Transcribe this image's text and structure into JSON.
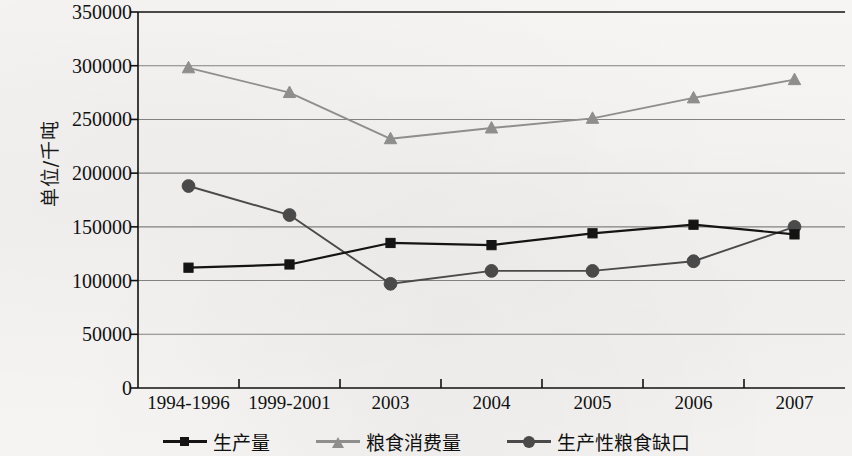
{
  "axis": {
    "y_title": "单位/千吨",
    "y_ticks": [
      "0",
      "50000",
      "100000",
      "150000",
      "200000",
      "250000",
      "300000",
      "350000"
    ],
    "x_ticks": [
      "1994-1996",
      "1999-2001",
      "2003",
      "2004",
      "2005",
      "2006",
      "2007"
    ]
  },
  "legend": {
    "items": [
      {
        "label": "生产量",
        "marker": "square-marker",
        "color": "#141414"
      },
      {
        "label": "粮食消费量",
        "marker": "triangle-marker",
        "color": "#8e8e8e"
      },
      {
        "label": "生产性粮食缺口",
        "marker": "circle-marker",
        "color": "#4a4a4a"
      }
    ]
  },
  "colors": {
    "production": "#141414",
    "consumption": "#8e8e8e",
    "gap": "#4a4a4a",
    "grid": "#6f6f6f",
    "axis": "#111111",
    "paper": "#f4f3f1"
  },
  "chart_data": {
    "type": "line",
    "title": "",
    "xlabel": "",
    "ylabel": "单位/千吨",
    "categories": [
      "1994-1996",
      "1999-2001",
      "2003",
      "2004",
      "2005",
      "2006",
      "2007"
    ],
    "ylim": [
      0,
      350000
    ],
    "ytick_step": 50000,
    "grid": true,
    "legend_position": "bottom",
    "series": [
      {
        "name": "生产量",
        "marker": "square",
        "color": "#141414",
        "values": [
          112000,
          115000,
          135000,
          133000,
          144000,
          152000,
          143000
        ]
      },
      {
        "name": "粮食消费量",
        "marker": "triangle",
        "color": "#8e8e8e",
        "values": [
          298000,
          275000,
          232000,
          242000,
          251000,
          270000,
          287000
        ]
      },
      {
        "name": "生产性粮食缺口",
        "marker": "circle",
        "color": "#4a4a4a",
        "values": [
          188000,
          161000,
          97000,
          109000,
          109000,
          118000,
          150000
        ]
      }
    ]
  }
}
